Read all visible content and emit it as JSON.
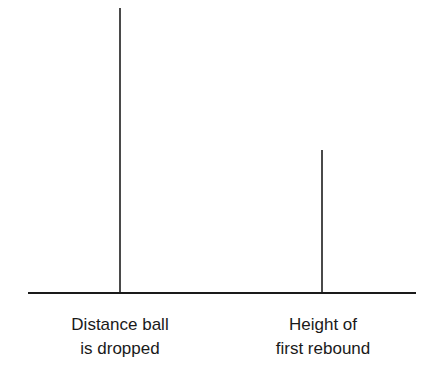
{
  "diagram": {
    "bars": [
      {
        "label_lines": [
          "Distance ball",
          "is dropped"
        ],
        "relative_height": 1.0
      },
      {
        "label_lines": [
          "Height of",
          "first rebound"
        ],
        "relative_height": 0.5
      }
    ],
    "colors": {
      "baseline": "#1a1a1a",
      "bars": "#4a4a4a",
      "text": "#1a1a1a",
      "background": "#ffffff"
    }
  }
}
